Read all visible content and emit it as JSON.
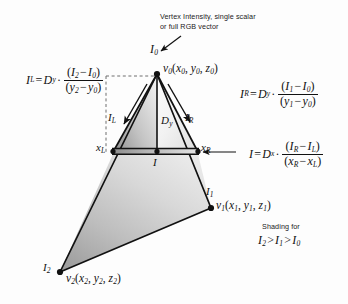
{
  "figure": {
    "type": "diagram",
    "annotation": {
      "line1": "Vertex Intensity, single scalar",
      "line2": "or full RGB vector"
    },
    "shading_note": {
      "caption": "Shading for",
      "relation_i2": "I",
      "relation_i2_sub": "2",
      "gt1": ">",
      "relation_i1": "I",
      "relation_i1_sub": "1",
      "gt2": ">",
      "relation_i0": "I",
      "relation_i0_sub": "0"
    },
    "vertices": [
      {
        "id": "v0",
        "intensity_label": "I",
        "intensity_sub": "0",
        "point_label": "v",
        "point_sub": "0",
        "coords": "(x0, y0, z0)",
        "coord_parts": [
          "x",
          "0",
          "y",
          "0",
          "z",
          "0"
        ],
        "x": 157,
        "y": 74
      },
      {
        "id": "v1",
        "intensity_label": "I",
        "intensity_sub": "1",
        "point_label": "v",
        "point_sub": "1",
        "coords": "(x1, y1, z1)",
        "coord_parts": [
          "x",
          "1",
          "y",
          "1",
          "z",
          "1"
        ],
        "x": 211,
        "y": 208
      },
      {
        "id": "v2",
        "intensity_label": "I",
        "intensity_sub": "2",
        "point_label": "v",
        "point_sub": "2",
        "coords": "(x2, y2, z2)",
        "coord_parts": [
          "x",
          "2",
          "y",
          "2",
          "z",
          "2"
        ],
        "x": 60,
        "y": 272
      }
    ],
    "scanline": {
      "left_label": "x",
      "left_sub": "L",
      "right_label": "x",
      "right_sub": "R",
      "mid_label": "I",
      "left_x": 113,
      "right_x": 198,
      "y": 152
    },
    "interior_labels": {
      "il": {
        "base": "I",
        "sub": "L"
      },
      "ir": {
        "base": "I",
        "sub": "R"
      },
      "dy": {
        "base": "D",
        "sub": "y"
      }
    },
    "equations": [
      {
        "id": "eq-il",
        "lhs_base": "I",
        "lhs_sub": "L",
        "eq": "=",
        "coef_base": "D",
        "coef_sub": "y",
        "dot": "·",
        "num": "(I2 − I0)",
        "num_parts": [
          "(",
          "I",
          "2",
          "−",
          "I",
          "0",
          ")"
        ],
        "den": "(y2 − y0)",
        "den_parts": [
          "(",
          "y",
          "2",
          "−",
          "y",
          "0",
          ")"
        ]
      },
      {
        "id": "eq-ir",
        "lhs_base": "I",
        "lhs_sub": "R",
        "eq": "=",
        "coef_base": "D",
        "coef_sub": "y",
        "dot": "·",
        "num": "(I1 − I0)",
        "num_parts": [
          "(",
          "I",
          "1",
          "−",
          "I",
          "0",
          ")"
        ],
        "den": "(y1 − y0)",
        "den_parts": [
          "(",
          "y",
          "1",
          "−",
          "y",
          "0",
          ")"
        ]
      },
      {
        "id": "eq-i",
        "lhs_base": "I",
        "lhs_sub": "",
        "eq": "=",
        "coef_base": "D",
        "coef_sub": "x",
        "dot": "·",
        "num": "(IR − IL)",
        "num_parts": [
          "(",
          "I",
          "R",
          "−",
          "I",
          "L",
          ")"
        ],
        "den": "(xR − xL)",
        "den_parts": [
          "(",
          "x",
          "R",
          "−",
          "x",
          "L",
          ")"
        ]
      }
    ],
    "colors": {
      "stroke": "#111111",
      "background": "#fdfdfd",
      "fill_light": "#f4f4f4",
      "fill_mid": "#c9c9c9",
      "fill_dark": "#9a9a9a",
      "dashed": "#6e6e6e"
    }
  }
}
